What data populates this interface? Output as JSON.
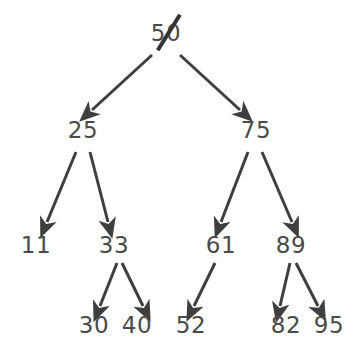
{
  "diagram": {
    "type": "binary-search-tree",
    "title": "",
    "background_color": "#ffffff",
    "node_text_color": "#4a4a4a",
    "edge_color": "#3f3f3f",
    "strike_color": "#333333",
    "nodes": [
      {
        "id": "n50",
        "label": "50",
        "x": 166,
        "y": 33,
        "level": 0,
        "struck_through": true
      },
      {
        "id": "n25",
        "label": "25",
        "x": 83,
        "y": 130,
        "level": 1,
        "struck_through": false
      },
      {
        "id": "n75",
        "label": "75",
        "x": 256,
        "y": 130,
        "level": 1,
        "struck_through": false
      },
      {
        "id": "n11",
        "label": "11",
        "x": 36,
        "y": 245,
        "level": 2,
        "struck_through": false
      },
      {
        "id": "n33",
        "label": "33",
        "x": 114,
        "y": 245,
        "level": 2,
        "struck_through": false
      },
      {
        "id": "n61",
        "label": "61",
        "x": 221,
        "y": 245,
        "level": 2,
        "struck_through": false
      },
      {
        "id": "n89",
        "label": "89",
        "x": 291,
        "y": 245,
        "level": 2,
        "struck_through": false
      },
      {
        "id": "n30",
        "label": "30",
        "x": 94,
        "y": 325,
        "level": 3,
        "struck_through": false
      },
      {
        "id": "n40",
        "label": "40",
        "x": 137,
        "y": 325,
        "level": 3,
        "struck_through": false
      },
      {
        "id": "n52",
        "label": "52",
        "x": 191,
        "y": 325,
        "level": 3,
        "struck_through": false
      },
      {
        "id": "n82",
        "label": "82",
        "x": 286,
        "y": 325,
        "level": 3,
        "struck_through": false
      },
      {
        "id": "n95",
        "label": "95",
        "x": 329,
        "y": 325,
        "level": 3,
        "struck_through": false
      }
    ],
    "edges": [
      {
        "from": "n50",
        "to": "n25",
        "side": "left",
        "x1": 152,
        "y1": 55,
        "x2": 92,
        "y2": 110
      },
      {
        "from": "n50",
        "to": "n75",
        "side": "right",
        "x1": 180,
        "y1": 55,
        "x2": 240,
        "y2": 110
      },
      {
        "from": "n25",
        "to": "n11",
        "side": "left",
        "x1": 76,
        "y1": 152,
        "x2": 47,
        "y2": 222
      },
      {
        "from": "n25",
        "to": "n33",
        "side": "right",
        "x1": 90,
        "y1": 152,
        "x2": 108,
        "y2": 222
      },
      {
        "from": "n75",
        "to": "n61",
        "side": "left",
        "x1": 248,
        "y1": 152,
        "x2": 221,
        "y2": 222
      },
      {
        "from": "n75",
        "to": "n89",
        "side": "right",
        "x1": 262,
        "y1": 152,
        "x2": 292,
        "y2": 222
      },
      {
        "from": "n33",
        "to": "n30",
        "side": "left",
        "x1": 117,
        "y1": 263,
        "x2": 100,
        "y2": 306
      },
      {
        "from": "n33",
        "to": "n40",
        "side": "right",
        "x1": 122,
        "y1": 263,
        "x2": 143,
        "y2": 306
      },
      {
        "from": "n61",
        "to": "n52",
        "side": "left",
        "x1": 215,
        "y1": 263,
        "x2": 194,
        "y2": 306
      },
      {
        "from": "n89",
        "to": "n82",
        "side": "left",
        "x1": 290,
        "y1": 263,
        "x2": 280,
        "y2": 306
      },
      {
        "from": "n89",
        "to": "n95",
        "side": "right",
        "x1": 296,
        "y1": 263,
        "x2": 318,
        "y2": 306
      }
    ]
  }
}
